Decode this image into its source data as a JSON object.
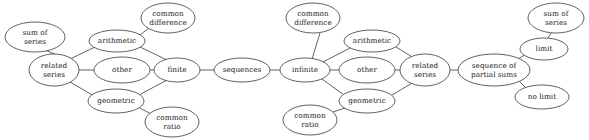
{
  "diagram": {
    "background_color": "#ffffff",
    "stroke_color": "#3a3a3a",
    "text_color": "#1b1b1b",
    "width": 589,
    "height": 140,
    "nodes": [
      {
        "id": "sum-of-series-left",
        "label_line1": "sum of",
        "label_line2": "series",
        "cx": 35,
        "cy": 37,
        "rx": 30,
        "ry": 15
      },
      {
        "id": "related-series-left",
        "label_line1": "related",
        "label_line2": "series",
        "cx": 54,
        "cy": 70,
        "rx": 25,
        "ry": 16
      },
      {
        "id": "arithmetic-left",
        "label_line1": "arithmetic",
        "label_line2": "",
        "cx": 117,
        "cy": 41,
        "rx": 28,
        "ry": 11
      },
      {
        "id": "common-difference-left",
        "label_line1": "common",
        "label_line2": "difference",
        "cx": 168,
        "cy": 18,
        "rx": 27,
        "ry": 15
      },
      {
        "id": "other-left",
        "label_line1": "other",
        "label_line2": "",
        "cx": 122,
        "cy": 70,
        "rx": 28,
        "ry": 13
      },
      {
        "id": "geometric-left",
        "label_line1": "geometric",
        "label_line2": "",
        "cx": 116,
        "cy": 101,
        "rx": 28,
        "ry": 12
      },
      {
        "id": "common-ratio-left",
        "label_line1": "common",
        "label_line2": "ratio",
        "cx": 172,
        "cy": 122,
        "rx": 27,
        "ry": 15
      },
      {
        "id": "finite",
        "label_line1": "finite",
        "label_line2": "",
        "cx": 177,
        "cy": 70,
        "rx": 23,
        "ry": 12
      },
      {
        "id": "sequences",
        "label_line1": "sequences",
        "label_line2": "",
        "cx": 242,
        "cy": 70,
        "rx": 28,
        "ry": 12
      },
      {
        "id": "infinite",
        "label_line1": "infinite",
        "label_line2": "",
        "cx": 305,
        "cy": 70,
        "rx": 25,
        "ry": 12
      },
      {
        "id": "common-difference-mid",
        "label_line1": "common",
        "label_line2": "difference",
        "cx": 313,
        "cy": 18,
        "rx": 27,
        "ry": 15
      },
      {
        "id": "arithmetic-right",
        "label_line1": "arithmetic",
        "label_line2": "",
        "cx": 372,
        "cy": 41,
        "rx": 28,
        "ry": 11
      },
      {
        "id": "other-right",
        "label_line1": "other",
        "label_line2": "",
        "cx": 367,
        "cy": 70,
        "rx": 28,
        "ry": 13
      },
      {
        "id": "geometric-right",
        "label_line1": "geometric",
        "label_line2": "",
        "cx": 367,
        "cy": 101,
        "rx": 28,
        "ry": 12
      },
      {
        "id": "common-ratio-mid",
        "label_line1": "common",
        "label_line2": "ratio",
        "cx": 310,
        "cy": 120,
        "rx": 27,
        "ry": 15
      },
      {
        "id": "related-series-right",
        "label_line1": "related",
        "label_line2": "series",
        "cx": 425,
        "cy": 70,
        "rx": 25,
        "ry": 16
      },
      {
        "id": "sequence-partial-sums",
        "label_line1": "sequence of",
        "label_line2": "partial sums",
        "cx": 494,
        "cy": 70,
        "rx": 36,
        "ry": 16
      },
      {
        "id": "limit",
        "label_line1": "limit",
        "label_line2": "",
        "cx": 544,
        "cy": 49,
        "rx": 24,
        "ry": 11
      },
      {
        "id": "sum-of-series-right",
        "label_line1": "sum of",
        "label_line2": "series",
        "cx": 556,
        "cy": 18,
        "rx": 28,
        "ry": 15
      },
      {
        "id": "no-limit",
        "label_line1": "no limit",
        "label_line2": "",
        "cx": 542,
        "cy": 97,
        "rx": 27,
        "ry": 12
      }
    ],
    "edges": [
      {
        "from": "sum-of-series-left",
        "to": "related-series-left",
        "x1": 45,
        "y1": 50,
        "x2": 57,
        "y2": 55
      },
      {
        "from": "related-series-left",
        "to": "arithmetic-left",
        "x1": 70,
        "y1": 59,
        "x2": 95,
        "y2": 47
      },
      {
        "from": "related-series-left",
        "to": "other-left",
        "x1": 79,
        "y1": 70,
        "x2": 94,
        "y2": 70
      },
      {
        "from": "related-series-left",
        "to": "geometric-left",
        "x1": 70,
        "y1": 82,
        "x2": 94,
        "y2": 96
      },
      {
        "from": "arithmetic-left",
        "to": "common-difference-left",
        "x1": 140,
        "y1": 35,
        "x2": 150,
        "y2": 27
      },
      {
        "from": "arithmetic-left",
        "to": "finite",
        "x1": 140,
        "y1": 47,
        "x2": 167,
        "y2": 60
      },
      {
        "from": "other-left",
        "to": "finite",
        "x1": 150,
        "y1": 70,
        "x2": 154,
        "y2": 70
      },
      {
        "from": "geometric-left",
        "to": "finite",
        "x1": 139,
        "y1": 95,
        "x2": 167,
        "y2": 80
      },
      {
        "from": "geometric-left",
        "to": "common-ratio-left",
        "x1": 138,
        "y1": 107,
        "x2": 153,
        "y2": 115
      },
      {
        "from": "finite",
        "to": "sequences",
        "x1": 200,
        "y1": 70,
        "x2": 214,
        "y2": 70
      },
      {
        "from": "sequences",
        "to": "infinite",
        "x1": 270,
        "y1": 70,
        "x2": 280,
        "y2": 70
      },
      {
        "from": "infinite",
        "to": "common-difference-mid",
        "x1": 312,
        "y1": 59,
        "x2": 320,
        "y2": 33
      },
      {
        "from": "infinite",
        "to": "arithmetic-right",
        "x1": 323,
        "y1": 62,
        "x2": 350,
        "y2": 48
      },
      {
        "from": "infinite",
        "to": "other-right",
        "x1": 330,
        "y1": 70,
        "x2": 339,
        "y2": 70
      },
      {
        "from": "infinite",
        "to": "geometric-right",
        "x1": 322,
        "y1": 79,
        "x2": 344,
        "y2": 95
      },
      {
        "from": "common-ratio-mid",
        "to": "geometric-right",
        "x1": 333,
        "y1": 112,
        "x2": 348,
        "y2": 107
      },
      {
        "from": "arithmetic-right",
        "to": "related-series-right",
        "x1": 396,
        "y1": 47,
        "x2": 414,
        "y2": 58
      },
      {
        "from": "other-right",
        "to": "related-series-right",
        "x1": 395,
        "y1": 70,
        "x2": 400,
        "y2": 70
      },
      {
        "from": "geometric-right",
        "to": "related-series-right",
        "x1": 392,
        "y1": 95,
        "x2": 414,
        "y2": 82
      },
      {
        "from": "related-series-right",
        "to": "sequence-partial-sums",
        "x1": 450,
        "y1": 70,
        "x2": 458,
        "y2": 70
      },
      {
        "from": "sequence-partial-sums",
        "to": "limit",
        "x1": 518,
        "y1": 59,
        "x2": 528,
        "y2": 53
      },
      {
        "from": "limit",
        "to": "sum-of-series-right",
        "x1": 548,
        "y1": 38,
        "x2": 551,
        "y2": 33
      },
      {
        "from": "sequence-partial-sums",
        "to": "no-limit",
        "x1": 519,
        "y1": 81,
        "x2": 528,
        "y2": 90
      }
    ]
  }
}
